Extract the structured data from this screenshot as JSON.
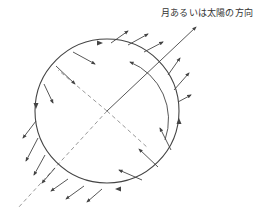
{
  "diagram": {
    "title_label": "月あるいは太陽の方向",
    "colors": {
      "line": "#444444",
      "dashed": "#999999",
      "background": "#ffffff"
    },
    "circle": {
      "cx": 107,
      "cy": 111,
      "r": 72
    },
    "direction_line": {
      "x1": 107,
      "y1": 111,
      "x2": 196,
      "y2": 27
    },
    "dashed_lines": [
      {
        "x1": 107,
        "y1": 111,
        "x2": 18,
        "y2": 208
      },
      {
        "x1": 107,
        "y1": 111,
        "x2": 58,
        "y2": 70
      },
      {
        "x1": 107,
        "y1": 111,
        "x2": 148,
        "y2": 148
      }
    ],
    "inner_arc": {
      "description": "inner arrowed arc near sun-facing side"
    },
    "arrows_outward_top": [
      {
        "x1": 111,
        "y1": 43,
        "x2": 128,
        "y2": 31
      },
      {
        "x1": 128,
        "y1": 45,
        "x2": 148,
        "y2": 34
      },
      {
        "x1": 144,
        "y1": 52,
        "x2": 163,
        "y2": 42
      },
      {
        "x1": 168,
        "y1": 75,
        "x2": 180,
        "y2": 58
      },
      {
        "x1": 174,
        "y1": 90,
        "x2": 189,
        "y2": 73
      },
      {
        "x1": 178,
        "y1": 102,
        "x2": 191,
        "y2": 95
      }
    ],
    "arrows_inward_top_left": [
      {
        "x1": 73,
        "y1": 52,
        "x2": 95,
        "y2": 64
      },
      {
        "x1": 56,
        "y1": 66,
        "x2": 75,
        "y2": 84
      },
      {
        "x1": 44,
        "y1": 84,
        "x2": 53,
        "y2": 103
      }
    ],
    "arrows_outward_bottom_left": [
      {
        "x1": 36,
        "y1": 121,
        "x2": 23,
        "y2": 138
      },
      {
        "x1": 38,
        "y1": 138,
        "x2": 26,
        "y2": 161
      },
      {
        "x1": 45,
        "y1": 155,
        "x2": 34,
        "y2": 175
      },
      {
        "x1": 55,
        "y1": 168,
        "x2": 42,
        "y2": 183
      },
      {
        "x1": 68,
        "y1": 179,
        "x2": 51,
        "y2": 191
      },
      {
        "x1": 84,
        "y1": 186,
        "x2": 66,
        "y2": 199
      },
      {
        "x1": 102,
        "y1": 189,
        "x2": 87,
        "y2": 202
      }
    ],
    "arrows_inward_bottom_right": [
      {
        "x1": 142,
        "y1": 180,
        "x2": 119,
        "y2": 170
      },
      {
        "x1": 158,
        "y1": 167,
        "x2": 139,
        "y2": 149
      },
      {
        "x1": 171,
        "y1": 150,
        "x2": 160,
        "y2": 128
      }
    ],
    "circle_flow_arrowheads": [
      {
        "x": 100,
        "y": 43,
        "angle": 0
      },
      {
        "x": 36,
        "y": 106,
        "angle": 90
      },
      {
        "x": 118,
        "y": 189,
        "angle": 180
      },
      {
        "x": 179,
        "y": 121,
        "angle": -90
      }
    ]
  }
}
